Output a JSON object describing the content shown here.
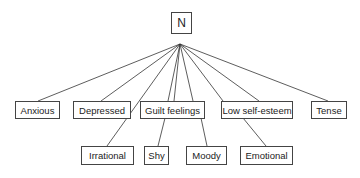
{
  "diagram": {
    "root": {
      "id": "N",
      "label": "N",
      "box": [
        171,
        12,
        21,
        22
      ]
    },
    "apex": [
      180,
      44
    ],
    "nodes": [
      {
        "id": "anxious",
        "label": "Anxious",
        "box": [
          15,
          101,
          45,
          18
        ],
        "anchor": [
          38,
          101
        ]
      },
      {
        "id": "depressed",
        "label": "Depressed",
        "box": [
          73,
          101,
          58,
          18
        ],
        "anchor": [
          101,
          101
        ]
      },
      {
        "id": "guilt",
        "label": "Guilt feelings",
        "box": [
          140,
          101,
          65,
          18
        ],
        "anchor": [
          172,
          101
        ]
      },
      {
        "id": "lowself",
        "label": "Low self-esteem",
        "box": [
          221,
          101,
          72,
          18
        ],
        "anchor": [
          246,
          101
        ]
      },
      {
        "id": "tense",
        "label": "Tense",
        "box": [
          311,
          101,
          36,
          18
        ],
        "anchor": [
          328,
          101
        ]
      },
      {
        "id": "irrational",
        "label": "Irrational",
        "box": [
          81,
          146,
          53,
          19
        ],
        "anchor": [
          107,
          146
        ]
      },
      {
        "id": "shy",
        "label": "Shy",
        "box": [
          144,
          146,
          25,
          19
        ],
        "anchor": [
          157,
          146
        ]
      },
      {
        "id": "moody",
        "label": "Moody",
        "box": [
          186,
          146,
          41,
          19
        ],
        "anchor": [
          206,
          146
        ]
      },
      {
        "id": "emotional",
        "label": "Emotional",
        "box": [
          240,
          146,
          53,
          19
        ],
        "anchor": [
          266,
          146
        ]
      }
    ],
    "edges": [
      {
        "from": [
          180,
          44
        ],
        "to": [
          38,
          101
        ]
      },
      {
        "from": [
          180,
          44
        ],
        "to": [
          101,
          101
        ]
      },
      {
        "from": [
          180,
          44
        ],
        "to": [
          107,
          146
        ]
      },
      {
        "from": [
          180,
          44
        ],
        "to": [
          168,
          101
        ]
      },
      {
        "from": [
          180,
          44
        ],
        "to": [
          174,
          101
        ]
      },
      {
        "from": [
          180,
          44
        ],
        "to": [
          193,
          101
        ]
      },
      {
        "from": [
          180,
          44
        ],
        "to": [
          223,
          101
        ]
      },
      {
        "from": [
          180,
          44
        ],
        "to": [
          259,
          101
        ]
      },
      {
        "from": [
          180,
          44
        ],
        "to": [
          328,
          101
        ]
      },
      {
        "from": [
          165,
          118
        ],
        "to": [
          158,
          146
        ]
      },
      {
        "from": [
          201,
          118
        ],
        "to": [
          207,
          146
        ]
      },
      {
        "from": [
          243,
          118
        ],
        "to": [
          266,
          146
        ]
      }
    ]
  }
}
